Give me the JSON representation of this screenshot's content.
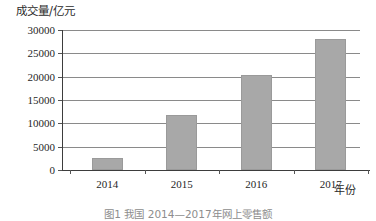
{
  "chart_data": {
    "type": "bar",
    "title": "",
    "ylabel": "成交量/亿元",
    "xlabel": "年份",
    "categories": [
      "2014",
      "2015",
      "2016",
      "2017"
    ],
    "values": [
      2500,
      11800,
      20300,
      28000
    ],
    "series": [
      {
        "name": "成交量",
        "values": [
          2500,
          11800,
          20300,
          28000
        ]
      }
    ],
    "ylim": [
      0,
      30000
    ],
    "yticks": [
      0,
      5000,
      10000,
      15000,
      20000,
      25000,
      30000
    ],
    "ytick_labels": [
      "0",
      "5000",
      "10000",
      "15000",
      "20000",
      "25000",
      "30000"
    ],
    "grid": true,
    "legend": false,
    "bar_color": "#a8a8a8",
    "gridline_color": "#8a8a8a",
    "axis_color": "#3d3d3d"
  },
  "caption": {
    "text": "图1  我国 2014—2017年网上零售额"
  }
}
